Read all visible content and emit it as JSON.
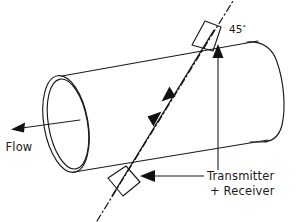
{
  "figure": {
    "background_color": "#ffffff",
    "line_color": "#1a1a1a",
    "width": 298,
    "height": 222
  },
  "labels": {
    "flow": "Flow",
    "angle": "45",
    "angle_unit": "°",
    "angle_full": "45°",
    "transducer_line1": "Transmitter",
    "transducer_line2": "+ Receiver"
  },
  "elements": {
    "pipe_name": "pipe-body",
    "pipe_open_end_name": "pipe-open-end-ellipse",
    "pipe_far_end_name": "pipe-far-end-curve",
    "flow_arrow_name": "flow-direction-arrow",
    "beam_name": "ultrasonic-beam-path",
    "axis_name": "beam-center-axis-dashdot",
    "upper_transducer_name": "upper-transducer-block",
    "lower_transducer_name": "lower-transducer-block",
    "angle_leader_name": "angle-leader-arrow",
    "transducer_leader_name": "transducer-leader-arrow"
  },
  "geometry": {
    "pipe_top_line": [
      [
        62,
        76
      ],
      [
        258,
        41
      ]
    ],
    "pipe_bottom_line": [
      [
        74,
        172
      ],
      [
        268,
        140
      ]
    ],
    "beam_line": [
      [
        112,
        196
      ],
      [
        214,
        30
      ]
    ],
    "axis_line": [
      [
        97,
        221
      ],
      [
        233,
        1
      ]
    ],
    "flow_arrow_tail": [
      80,
      120
    ],
    "flow_arrow_tip": [
      12,
      129
    ]
  }
}
